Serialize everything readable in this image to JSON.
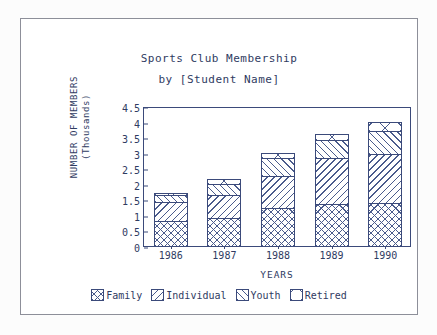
{
  "chart_data": {
    "type": "bar",
    "subtype": "stacked-bar",
    "title": "Sports Club Membership",
    "subtitle": "by [Student Name]",
    "xlabel": "YEARS",
    "ylabel_line1": "NUMBER OF MEMBERS",
    "ylabel_line2": "(Thousands)",
    "categories": [
      "1986",
      "1987",
      "1988",
      "1989",
      "1990"
    ],
    "ylim": [
      0,
      4.5
    ],
    "yticks": [
      "0",
      "0.5",
      "1",
      "1.5",
      "2",
      "2.5",
      "3",
      "3.5",
      "4",
      "4.5"
    ],
    "ytick_values": [
      0,
      0.5,
      1,
      1.5,
      2,
      2.5,
      3,
      3.5,
      4,
      4.5
    ],
    "grid": false,
    "legend_position": "bottom",
    "series": [
      {
        "name": "Family",
        "pattern": "cross-hatch",
        "values": [
          0.85,
          0.92,
          1.27,
          1.38,
          1.43
        ]
      },
      {
        "name": "Individual",
        "pattern": "diagonal-down",
        "values": [
          0.62,
          0.78,
          1.05,
          1.5,
          1.6
        ]
      },
      {
        "name": "Youth",
        "pattern": "diagonal-up",
        "values": [
          0.26,
          0.38,
          0.6,
          0.63,
          0.75
        ]
      },
      {
        "name": "Retired",
        "pattern": "x-box",
        "values": [
          0.07,
          0.2,
          0.2,
          0.23,
          0.32
        ]
      }
    ],
    "totals": [
      1.8,
      2.28,
      3.12,
      3.74,
      4.1
    ],
    "colors": {
      "ink": "#2f3b62",
      "axis": "#3b4a7a",
      "hatch": "#4a5b8c",
      "background": "#ffffff",
      "frame": "#8d8f99"
    }
  },
  "legend": {
    "items": [
      {
        "label": "Family"
      },
      {
        "label": "Individual"
      },
      {
        "label": "Youth"
      },
      {
        "label": "Retired"
      }
    ]
  }
}
